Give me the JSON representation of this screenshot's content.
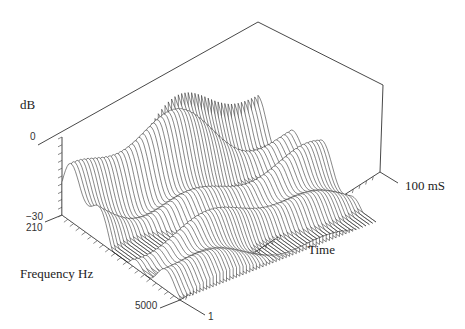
{
  "chart_data": {
    "type": "surface-waterfall",
    "title": "",
    "axes": {
      "z": {
        "label": "dB",
        "ticks": [
          "0",
          "-30"
        ],
        "range": [
          -30,
          0
        ]
      },
      "frequency": {
        "label": "Frequency Hz",
        "ticks": [
          "210",
          "5000"
        ],
        "range": [
          210,
          5000
        ]
      },
      "time": {
        "label": "Time",
        "ticks": [
          "1",
          "100 mS"
        ],
        "range_ms": [
          1,
          100
        ]
      }
    },
    "grid": false,
    "legend": null
  },
  "labels": {
    "db": "dB",
    "zero": "0",
    "minus30": "−30",
    "f210": "210",
    "freq": "Frequency Hz",
    "f5000": "5000",
    "t1": "1",
    "time": "Time",
    "t100": "100 mS"
  }
}
